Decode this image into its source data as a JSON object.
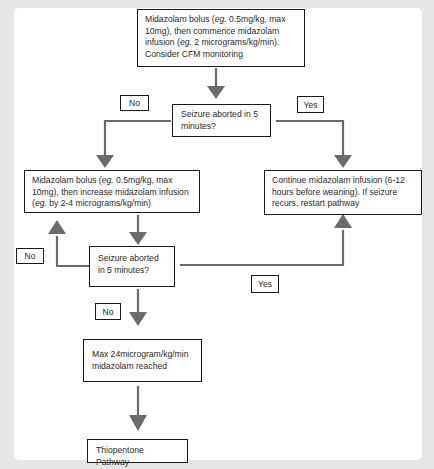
{
  "diagram": {
    "type": "flowchart",
    "colors": {
      "arrow": "#6b6b6b",
      "box_border": "#1a1a1a",
      "background": "#e6e6e6",
      "panel": "#ffffff"
    },
    "nodes": {
      "start": {
        "pre1": "Midazolam bolus (",
        "eg1": "eg.",
        "mid1": " 0.5mg/kg, max 10mg), then commence midazolam infusion (",
        "eg2": "eg.",
        "post": " 2 micrograms/kg/min). Consider CFM monitoring"
      },
      "decision1": "Seizure aborted in 5 minutes?",
      "increase": {
        "pre1": "Midazolam bolus (",
        "eg1": "eg.",
        "mid1": " 0.5mg/kg, max 10mg), then increase midazolam infusion (",
        "eg2": "eg.",
        "post": " by 2-4 micrograms/kg/min)"
      },
      "continue": "Continue midazolam infusion (6-12 hours before weaning). If seizure recurs, restart pathway",
      "decision2": "Seizure aborted in 5 minutes?",
      "max_reached": "Max 24microgram/kg/min midazolam reached",
      "thiopentone": "Thiopentone Pathway"
    },
    "edge_labels": {
      "d1_no": "No",
      "d1_yes": "Yes",
      "d2_no_loop": "No",
      "d2_yes": "Yes",
      "d2_no_down": "No"
    }
  }
}
